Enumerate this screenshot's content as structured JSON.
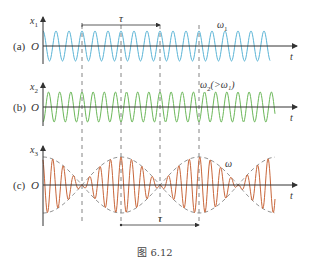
{
  "figure": {
    "caption": "图 6.12",
    "dashed_lines_x": [
      82,
      121,
      160,
      199
    ],
    "panels": [
      {
        "id": "a",
        "label": "(a)",
        "axis_label": "x",
        "axis_sub": "1",
        "origin_label": "O",
        "t_label": "t",
        "freq_label": "ω",
        "freq_sub": "1",
        "freq_extra": "",
        "color": "#5ab4d6",
        "axis_y": 46,
        "amplitude": 15,
        "period_px": 13.0,
        "wave_x_start": 43,
        "wave_x_end": 270
      },
      {
        "id": "b",
        "label": "(b)",
        "axis_label": "x",
        "axis_sub": "2",
        "origin_label": "O",
        "t_label": "t",
        "freq_label": "ω",
        "freq_sub": "2",
        "freq_extra": "(>ω₁)",
        "color": "#6cb85a",
        "axis_y": 107,
        "amplitude": 15,
        "period_px": 11.14,
        "wave_x_start": 43,
        "wave_x_end": 275
      },
      {
        "id": "c",
        "label": "(c)",
        "axis_label": "x",
        "axis_sub": "3",
        "origin_label": "O",
        "t_label": "t",
        "freq_label": "ω",
        "color": "#c8663a",
        "envelope_color": "#777777",
        "axis_y": 185,
        "amplitude": 28,
        "wave_x_start": 43,
        "wave_x_end": 275
      }
    ],
    "tau_top": {
      "label": "τ",
      "x1": 82,
      "x2": 160,
      "y": 25
    },
    "tau_bottom": {
      "label": "τ",
      "x1": 121,
      "x2": 199,
      "y": 225
    }
  }
}
